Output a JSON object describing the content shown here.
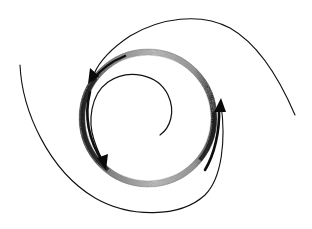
{
  "diagram": {
    "title": "",
    "description": "Hand-drawn spiral diagram: a stippled circular ring with three arrowheads indicating rotation, surrounded by spiral arms",
    "colors": {
      "ink": "#111111",
      "ring_light": "#b8b8b8",
      "ring_dark": "#3a3a3a",
      "background": "#ffffff"
    },
    "ring": {
      "cx": 148,
      "cy": 118,
      "r": 66,
      "band_width": 6
    },
    "arrows": [
      {
        "id": "upper-left",
        "direction": "counter-clockwise",
        "x": 92,
        "y": 76
      },
      {
        "id": "lower-left",
        "direction": "counter-clockwise",
        "x": 104,
        "y": 166
      },
      {
        "id": "right",
        "direction": "counter-clockwise",
        "x": 221,
        "y": 104
      }
    ],
    "labels": []
  }
}
